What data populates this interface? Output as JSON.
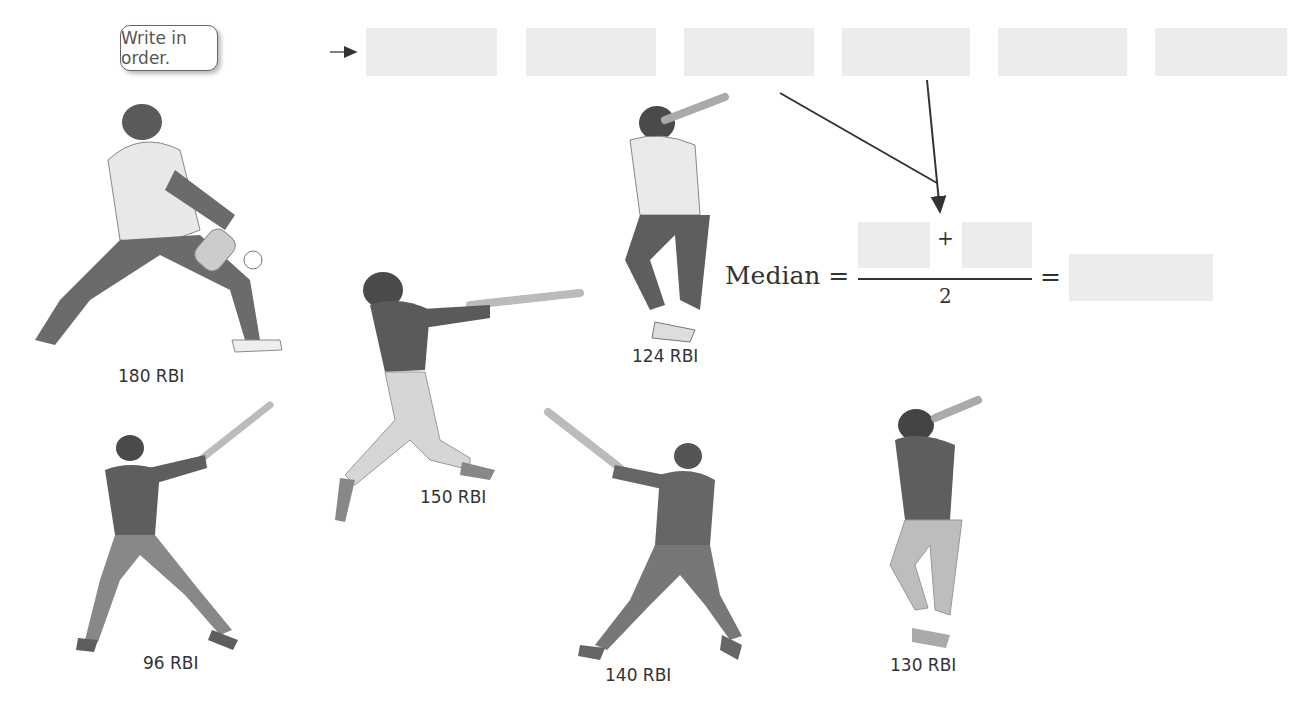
{
  "header": {
    "callout_text": "Write in order."
  },
  "order_boxes": [
    "",
    "",
    "",
    "",
    "",
    ""
  ],
  "formula": {
    "label": "Median",
    "equals": "=",
    "plus": "+",
    "denominator": "2",
    "numerator_a": "",
    "numerator_b": "",
    "result": ""
  },
  "players": [
    {
      "label": "180 RBI"
    },
    {
      "label": "124 RBI"
    },
    {
      "label": "150 RBI"
    },
    {
      "label": "96 RBI"
    },
    {
      "label": "140 RBI"
    },
    {
      "label": "130 RBI"
    }
  ],
  "colors": {
    "box_fill": "#ececec",
    "arrow": "#333333"
  }
}
